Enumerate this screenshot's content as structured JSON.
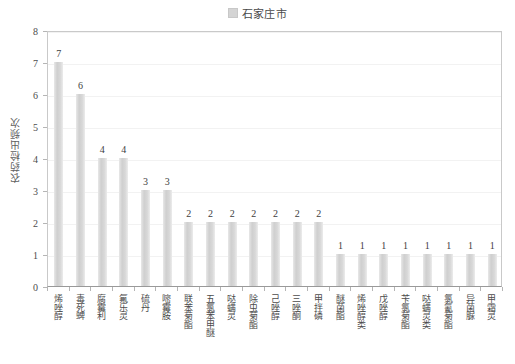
{
  "legend": {
    "swatch_color": "#d4d4d4",
    "label": "石家庄市",
    "position": "top-center"
  },
  "axis": {
    "y_title": "农药检出频次",
    "y_ticks": [
      "0",
      "1",
      "2",
      "3",
      "4",
      "5",
      "6",
      "7",
      "8"
    ]
  },
  "chart_data": {
    "type": "bar",
    "title": "",
    "subtitle": "",
    "xlabel": "",
    "ylabel": "农药检出频次",
    "ylim": [
      0,
      8
    ],
    "grid": true,
    "legend_position": "top-center",
    "series_name": "石家庄市",
    "bar_color": "#d4d4d4",
    "categories": [
      "烯唑醇",
      "毒死蜱",
      "腐霉利",
      "氟乐灵",
      "硫丹",
      "嘧霉胺",
      "联苯菊酯",
      "五氯苯甲醚",
      "哒螨灵",
      "除虫菊酯",
      "己唑醇",
      "三唑酮",
      "甲拌磷",
      "醚菌酯",
      "烯唑醇类",
      "戊唑醇",
      "苄氯菊酯",
      "哒螨灵类",
      "氯氰菊酯",
      "异菌脲",
      "甲霜灵"
    ],
    "values": [
      7,
      6,
      4,
      4,
      3,
      3,
      2,
      2,
      2,
      2,
      2,
      2,
      2,
      1,
      1,
      1,
      1,
      1,
      1,
      1,
      1
    ],
    "data_labels": [
      "7",
      "6",
      "4",
      "4",
      "3",
      "3",
      "2",
      "2",
      "2",
      "2",
      "2",
      "2",
      "2",
      "1",
      "1",
      "1",
      "1",
      "1",
      "1",
      "1",
      "1"
    ]
  }
}
